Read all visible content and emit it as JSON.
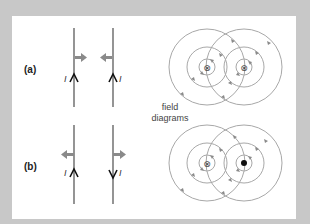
{
  "diagram": {
    "colors": {
      "frame": "#c8c8c8",
      "panel": "#ffffff",
      "wire": "#7a7a7a",
      "force_arrow": "#8a8a8a",
      "field_line": "#a8a8a8",
      "field_arrow": "#8a8a8a",
      "text": "#222222"
    },
    "center_caption": [
      "field",
      "diagrams"
    ],
    "parts": [
      {
        "label": "(a)",
        "current_label": "I",
        "wire_left_current": "up",
        "wire_right_current": "up",
        "force": "attract",
        "field_left_symbol": "⊗",
        "field_right_symbol": "⊗"
      },
      {
        "label": "(b)",
        "current_label": "I",
        "wire_left_current": "up",
        "wire_right_current": "down",
        "force": "repel",
        "field_left_symbol": "⊗",
        "field_right_symbol": "●"
      }
    ]
  }
}
